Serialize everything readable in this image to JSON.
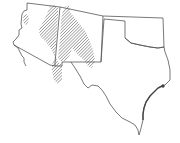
{
  "map": {
    "type": "range-map",
    "region": "Southwestern United States",
    "states": [
      "Arizona",
      "New Mexico",
      "Oklahoma",
      "Texas"
    ],
    "hatch_areas": [
      {
        "name": "northeastern-arizona-to-southwest-new-mexico"
      },
      {
        "name": "central-new-mexico"
      },
      {
        "name": "western-arizona-outlier"
      }
    ],
    "colors": {
      "border": "#555555",
      "hatch": "#555555",
      "background": "#ffffff"
    }
  }
}
